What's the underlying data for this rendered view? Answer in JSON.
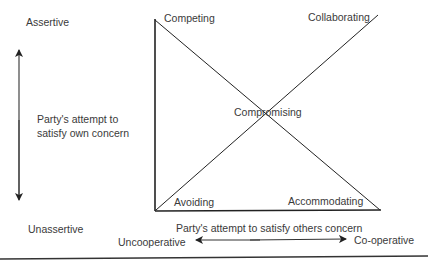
{
  "diagram": {
    "vertical_axis": {
      "top_label": "Assertive",
      "bottom_label": "Unassertive",
      "description_line1": "Party's attempt to",
      "description_line2": "satisfy own concern"
    },
    "horizontal_axis": {
      "description": "Party's attempt to satisfy others concern",
      "left_label": "Uncooperative",
      "right_label": "Co-operative"
    },
    "modes": {
      "top_left": "Competing",
      "top_right": "Collaborating",
      "center": "Compromising",
      "bottom_left": "Avoiding",
      "bottom_right": "Accommodating"
    },
    "colors": {
      "line": "#222222",
      "text": "#3a3a3a",
      "background": "#ffffff"
    }
  }
}
